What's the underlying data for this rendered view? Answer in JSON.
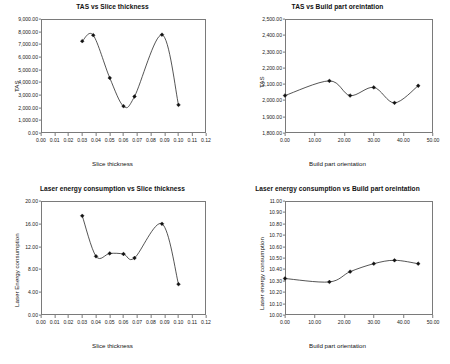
{
  "figure": {
    "panels": [
      "top-left",
      "top-right",
      "bottom-left",
      "bottom-right"
    ]
  },
  "chart_data": [
    {
      "id": "tas-vs-slice-thickness",
      "type": "scatter",
      "title": "TAS vs Slice thickness",
      "xlabel": "Slice thickness",
      "ylabel": "TAS",
      "xlim": [
        0.0,
        0.12
      ],
      "ylim": [
        0.0,
        9000.0
      ],
      "grid": false,
      "legend": "none",
      "xticks": [
        "0.00",
        "0.01",
        "0.02",
        "0.03",
        "0.04",
        "0.05",
        "0.06",
        "0.07",
        "0.08",
        "0.09",
        "0.10",
        "0.11",
        "0.12"
      ],
      "xtick_values": [
        0.0,
        0.01,
        0.02,
        0.03,
        0.04,
        0.05,
        0.06,
        0.07,
        0.08,
        0.09,
        0.1,
        0.11,
        0.12
      ],
      "yticks": [
        "0.00",
        "1,000.00",
        "2,000.00",
        "3,000.00",
        "4,000.00",
        "5,000.00",
        "6,000.00",
        "7,000.00",
        "8,000.00",
        "9,000.00"
      ],
      "ytick_values": [
        0,
        1000,
        2000,
        3000,
        4000,
        5000,
        6000,
        7000,
        8000,
        9000
      ],
      "x": [
        0.03,
        0.038,
        0.05,
        0.06,
        0.068,
        0.088,
        0.1
      ],
      "y": [
        7250,
        7720,
        4350,
        2120,
        2880,
        7760,
        2220
      ],
      "fit": "smooth cubic spline through markers"
    },
    {
      "id": "tas-vs-build-part-orientation",
      "type": "scatter",
      "title": "TAS vs Build part oreintation",
      "xlabel": "Build part orientation",
      "ylabel": "TAS",
      "xlim": [
        0.0,
        50.0
      ],
      "ylim": [
        1800.0,
        2500.0
      ],
      "grid": false,
      "legend": "none",
      "xticks": [
        "0.00",
        "10.00",
        "20.00",
        "30.00",
        "40.00",
        "50.00"
      ],
      "xtick_values": [
        0,
        10,
        20,
        30,
        40,
        50
      ],
      "yticks": [
        "1,800.00",
        "1,900.00",
        "2,000.00",
        "2,100.00",
        "2,200.00",
        "2,300.00",
        "2,400.00",
        "2,500.00"
      ],
      "ytick_values": [
        1800,
        1900,
        2000,
        2100,
        2200,
        2300,
        2400,
        2500
      ],
      "x": [
        0.0,
        15.0,
        22.0,
        30.0,
        37.0,
        45.0
      ],
      "y": [
        2030,
        2120,
        2030,
        2080,
        1985,
        2090
      ],
      "fit": "smooth cubic spline"
    },
    {
      "id": "laser-energy-vs-slice-thickness",
      "type": "scatter",
      "title": "Laser energy consumption vs Slice thickness",
      "xlabel": "Slice thickness",
      "ylabel": "Laser Energy consumption",
      "xlim": [
        0.0,
        0.12
      ],
      "ylim": [
        0.0,
        20.0
      ],
      "grid": false,
      "legend": "none",
      "xticks": [
        "0.00",
        "0.01",
        "0.02",
        "0.03",
        "0.04",
        "0.05",
        "0.06",
        "0.07",
        "0.08",
        "0.09",
        "0.10",
        "0.11",
        "0.12"
      ],
      "xtick_values": [
        0.0,
        0.01,
        0.02,
        0.03,
        0.04,
        0.05,
        0.06,
        0.07,
        0.08,
        0.09,
        0.1,
        0.11,
        0.12
      ],
      "yticks": [
        "0.00",
        "4.00",
        "8.00",
        "12.00",
        "16.00",
        "20.00"
      ],
      "ytick_values": [
        0,
        4,
        8,
        12,
        16,
        20
      ],
      "x": [
        0.03,
        0.04,
        0.05,
        0.06,
        0.068,
        0.088,
        0.1
      ],
      "y": [
        17.4,
        10.3,
        10.8,
        10.7,
        10.0,
        16.0,
        5.4
      ],
      "fit": "smooth cubic spline through markers"
    },
    {
      "id": "laser-energy-vs-build-part-orientation",
      "type": "scatter",
      "title": "Laser energy consumption vs Build part oreintation",
      "xlabel": "Build part orientation",
      "ylabel": "Laser energy consumption",
      "xlim": [
        0.0,
        50.0
      ],
      "ylim": [
        10.0,
        11.0
      ],
      "grid": false,
      "legend": "none",
      "xticks": [
        "0.00",
        "10.00",
        "20.00",
        "30.00",
        "40.00",
        "50.00"
      ],
      "xtick_values": [
        0,
        10,
        20,
        30,
        40,
        50
      ],
      "yticks": [
        "10.00",
        "10.10",
        "10.20",
        "10.30",
        "10.40",
        "10.50",
        "10.60",
        "10.70",
        "10.80",
        "10.90",
        "11.00"
      ],
      "ytick_values": [
        10.0,
        10.1,
        10.2,
        10.3,
        10.4,
        10.5,
        10.6,
        10.7,
        10.8,
        10.9,
        11.0
      ],
      "x": [
        0.0,
        15.0,
        22.0,
        30.0,
        37.0,
        45.0
      ],
      "y": [
        10.32,
        10.29,
        10.38,
        10.45,
        10.48,
        10.45
      ],
      "fit": "smooth cubic spline"
    }
  ]
}
